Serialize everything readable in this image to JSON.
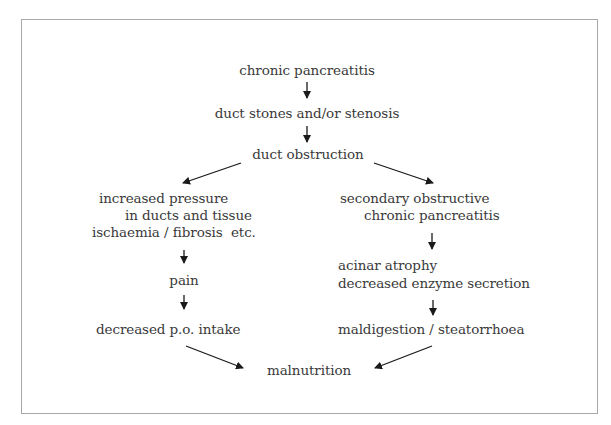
{
  "diagram": {
    "type": "flowchart",
    "nodes": {
      "chronic_pancreatitis": "chronic pancreatitis",
      "duct_stones": "duct stones and/or stenosis",
      "duct_obstruction": "duct obstruction",
      "increased_pressure_1": "increased pressure",
      "increased_pressure_2": "in ducts and tissue",
      "increased_pressure_3": "ischaemia / fibrosis  etc.",
      "pain": "pain",
      "decreased_intake": "decreased p.o. intake",
      "secondary_1": "secondary obstructive",
      "secondary_2": "chronic pancreatitis",
      "acinar_1": "acinar atrophy",
      "acinar_2": "decreased enzyme secretion",
      "maldigestion": "maldigestion / steatorrhoea",
      "malnutrition": "malnutrition"
    },
    "edges": [
      {
        "from": "chronic pancreatitis",
        "to": "duct stones and/or stenosis"
      },
      {
        "from": "duct stones and/or stenosis",
        "to": "duct obstruction"
      },
      {
        "from": "duct obstruction",
        "to": "increased pressure in ducts and tissue ischaemia / fibrosis etc."
      },
      {
        "from": "duct obstruction",
        "to": "secondary obstructive chronic pancreatitis"
      },
      {
        "from": "increased pressure in ducts and tissue ischaemia / fibrosis etc.",
        "to": "pain"
      },
      {
        "from": "pain",
        "to": "decreased p.o. intake"
      },
      {
        "from": "secondary obstructive chronic pancreatitis",
        "to": "acinar atrophy decreased enzyme secretion"
      },
      {
        "from": "acinar atrophy decreased enzyme secretion",
        "to": "maldigestion / steatorrhoea"
      },
      {
        "from": "decreased p.o. intake",
        "to": "malnutrition"
      },
      {
        "from": "maldigestion / steatorrhoea",
        "to": "malnutrition"
      }
    ],
    "colors": {
      "text": "#3a3a3a",
      "arrow": "#1a1a1a",
      "border": "#a8a8a8",
      "background": "#ffffff"
    }
  }
}
